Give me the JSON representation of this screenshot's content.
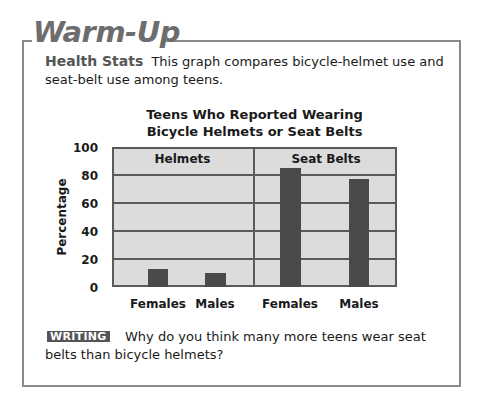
{
  "header": {
    "title": "Warm-Up"
  },
  "intro": {
    "lead": "Health Stats",
    "text": "This graph compares bicycle-helmet use and seat-belt use among teens."
  },
  "chart_data": {
    "type": "bar",
    "title": "Teens Who Reported Wearing Bicycle Helmets or Seat Belts",
    "title_lines": [
      "Teens Who Reported Wearing",
      "Bicycle Helmets or Seat Belts"
    ],
    "xlabel": "",
    "ylabel": "Percentage",
    "ylim": [
      0,
      100
    ],
    "yticks": [
      "100",
      "80",
      "60",
      "40",
      "20",
      "0"
    ],
    "grid": true,
    "panels": [
      {
        "name": "Helmets",
        "categories": [
          "Females",
          "Males"
        ],
        "values": [
          13,
          10
        ]
      },
      {
        "name": "Seat Belts",
        "categories": [
          "Females",
          "Males"
        ],
        "values": [
          85,
          77
        ]
      }
    ],
    "colors": {
      "bar": "#4a4a4a",
      "plot_background": "#dcdcdc",
      "gridline": "#5a5a5a"
    }
  },
  "writing": {
    "badge": "WRITING",
    "question": "Why do you think many more teens wear seat belts than bicycle helmets?"
  }
}
